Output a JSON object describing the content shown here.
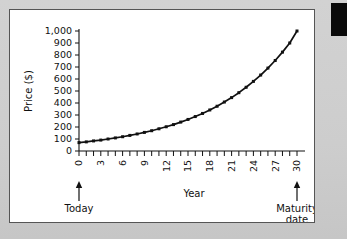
{
  "figure": {
    "background_color": "#cdcdcd",
    "panel_color": "#ffffff",
    "panel_border_color": "#555555",
    "marker_color": "#111111"
  },
  "decoration": {
    "black_tab_name": "black-edge-marker"
  },
  "chart_data": {
    "type": "line",
    "title": "",
    "xlabel": "Year",
    "ylabel": "Price ($)",
    "xlim": [
      0,
      30
    ],
    "ylim": [
      0,
      1000
    ],
    "grid": false,
    "legend": "none",
    "marker": "square",
    "x_tick_labels": [
      "0",
      "3",
      "6",
      "9",
      "12",
      "15",
      "18",
      "21",
      "24",
      "27",
      "30"
    ],
    "x_tick_values": [
      0,
      3,
      6,
      9,
      12,
      15,
      18,
      21,
      24,
      27,
      30
    ],
    "x_minor_tick_step": 1,
    "y_tick_labels": [
      "0",
      "100",
      "200",
      "300",
      "400",
      "500",
      "600",
      "700",
      "800",
      "900",
      "1,000"
    ],
    "y_tick_values": [
      0,
      100,
      200,
      300,
      400,
      500,
      600,
      700,
      800,
      900,
      1000
    ],
    "series": [
      {
        "name": "Zero-coupon bond price",
        "x": [
          0,
          1,
          2,
          3,
          4,
          5,
          6,
          7,
          8,
          9,
          10,
          11,
          12,
          13,
          14,
          15,
          16,
          17,
          18,
          19,
          20,
          21,
          22,
          23,
          24,
          25,
          26,
          27,
          28,
          29,
          30
        ],
        "values": [
          70,
          76,
          84,
          91,
          100,
          109,
          119,
          130,
          142,
          155,
          169,
          185,
          202,
          220,
          241,
          263,
          287,
          313,
          342,
          373,
          408,
          445,
          486,
          531,
          580,
          633,
          691,
          754,
          824,
          900,
          1000
        ]
      }
    ],
    "annotations": [
      {
        "name": "today",
        "text": "Today",
        "x_value": 0,
        "arrow": "up"
      },
      {
        "name": "maturity-date",
        "text_line1": "Maturity",
        "text_line2": "date",
        "x_value": 30,
        "arrow": "up"
      }
    ]
  }
}
